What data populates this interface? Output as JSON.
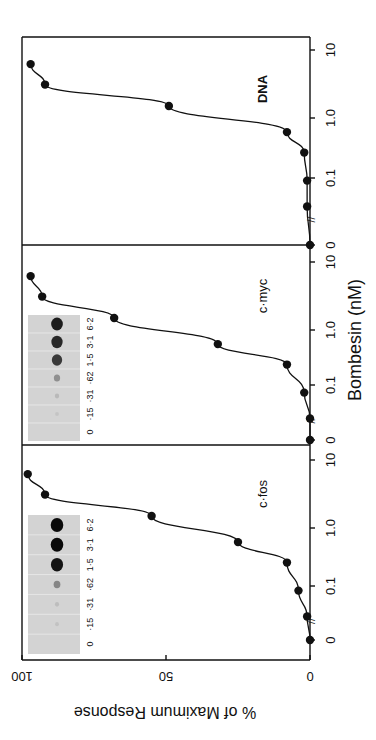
{
  "figure": {
    "orientation": "rotated-90-cw",
    "ylabel": "% of Maximum Response",
    "xlabel": "Bombesin (nM)",
    "y_ticks": [
      "0",
      "50",
      "100"
    ],
    "x_ticks": [
      "0",
      "0.1",
      "1.0",
      "10"
    ],
    "x_break_marker": "//"
  },
  "panels": [
    {
      "name": "c-fos",
      "label": "c·fos",
      "has_blot": true,
      "blot_lanes": [
        "0",
        "·15",
        "·31",
        "·62",
        "1·5",
        "3·1",
        "6·2"
      ],
      "blot_intensity": [
        0.0,
        0.03,
        0.06,
        0.35,
        0.95,
        1.0,
        1.0
      ]
    },
    {
      "name": "c-myc",
      "label": "c·myc",
      "has_blot": true,
      "blot_lanes": [
        "0",
        "·15",
        "·31",
        "·62",
        "1·5",
        "3·1",
        "6·2"
      ],
      "blot_intensity": [
        0.0,
        0.02,
        0.08,
        0.3,
        0.75,
        0.85,
        0.9
      ]
    },
    {
      "name": "DNA",
      "label": "DNA",
      "has_blot": false,
      "blot_lanes": [],
      "blot_intensity": []
    }
  ],
  "chart_data": {
    "type": "line",
    "title": "",
    "xlabel": "Bombesin (nM)",
    "ylabel": "% of Maximum Response",
    "x_scale": "log (with break at 0)",
    "x": [
      0,
      0.05,
      0.12,
      0.31,
      0.62,
      1.5,
      3.1,
      6.2
    ],
    "xticks": [
      "0",
      "0.1",
      "1.0",
      "10"
    ],
    "ylim": [
      0,
      100
    ],
    "yticks": [
      0,
      50,
      100
    ],
    "grid": false,
    "legend": "panel labels inside each plot",
    "series": [
      {
        "name": "c-fos",
        "values": [
          0,
          1,
          4,
          8,
          25,
          55,
          92,
          98
        ]
      },
      {
        "name": "c-myc",
        "values": [
          0,
          0,
          2,
          8,
          32,
          68,
          93,
          97
        ]
      },
      {
        "name": "DNA",
        "values": [
          0,
          1,
          1,
          2,
          8,
          49,
          92,
          97
        ]
      }
    ],
    "insets": [
      {
        "panel": "c-fos",
        "type": "dot blot",
        "lane_labels": [
          "0",
          "·15",
          "·31",
          "·62",
          "1·5",
          "3·1",
          "6·2"
        ]
      },
      {
        "panel": "c-myc",
        "type": "dot blot",
        "lane_labels": [
          "0",
          "·15",
          "·31",
          "·62",
          "1·5",
          "3·1",
          "6·2"
        ]
      }
    ]
  }
}
